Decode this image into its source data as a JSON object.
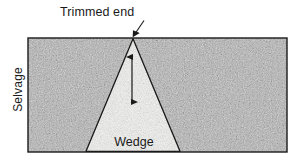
{
  "figure": {
    "title_alt": "Wedge template placed on fabric with trimmed end at selvage",
    "labels": {
      "trimmed_end": "Trimmed end",
      "selvage": "Selvage",
      "wedge_line1": "Wedge",
      "wedge_line2": "template"
    },
    "colors": {
      "fabric_fill": "#b5b5b5",
      "fabric_speckle_light": "#d6d6d6",
      "fabric_speckle_dark": "#9a9a9a",
      "template_fill": "#f2f2f0",
      "outline": "#1a1a1a",
      "text": "#1a1a1a",
      "background": "#ffffff"
    },
    "geometry": {
      "fabric_rect": {
        "x": 28,
        "y": 38,
        "width": 259,
        "height": 114
      },
      "wedge_apex": {
        "x": 133,
        "y": 38
      },
      "wedge_base_left": {
        "x": 86,
        "y": 152
      },
      "wedge_base_right": {
        "x": 180,
        "y": 152
      },
      "height_arrow": {
        "x": 132,
        "y_top": 56,
        "y_bottom": 103
      },
      "leader_line": {
        "x1": 143,
        "y1": 21,
        "x2": 132,
        "y2": 37
      }
    }
  }
}
